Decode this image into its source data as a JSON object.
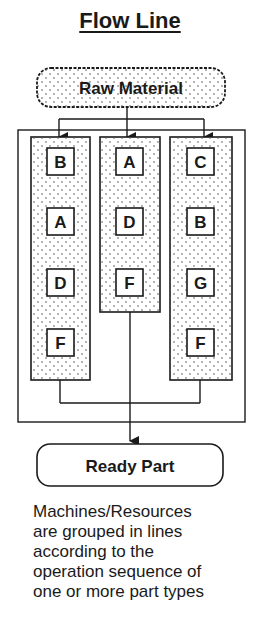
{
  "title": "Flow Line",
  "source_node": {
    "label": "Raw Material"
  },
  "sink_node": {
    "label": "Ready Part"
  },
  "lines": [
    {
      "name": "line-1",
      "machines": [
        "B",
        "A",
        "D",
        "F"
      ]
    },
    {
      "name": "line-2",
      "machines": [
        "A",
        "D",
        "F"
      ]
    },
    {
      "name": "line-3",
      "machines": [
        "C",
        "B",
        "G",
        "F"
      ]
    }
  ],
  "caption": [
    "Machines/Resources",
    "are grouped in lines",
    "according to the",
    "operation sequence of",
    "one or more part types"
  ],
  "colors": {
    "stroke": "#1a1a1a",
    "background": "#ffffff",
    "dot": "#555555"
  }
}
